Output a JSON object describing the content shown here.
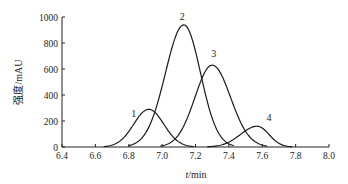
{
  "chart_data": {
    "type": "line",
    "title": "",
    "xlabel": "t/min",
    "ylabel": "强度/mAU",
    "xlim": [
      6.4,
      8.0
    ],
    "ylim": [
      0,
      1000
    ],
    "xticks": [
      "6.4",
      "6.6",
      "6.8",
      "7.0",
      "7.2",
      "7.4",
      "7.6",
      "7.8",
      "8.0"
    ],
    "yticks": [
      "0",
      "200",
      "400",
      "600",
      "800",
      "1000"
    ],
    "grid": false,
    "legend": null,
    "series": [
      {
        "name": "1",
        "center": 6.92,
        "height": 290,
        "start": 6.65,
        "end": 7.19
      },
      {
        "name": "2",
        "center": 7.13,
        "height": 940,
        "start": 6.8,
        "end": 7.43
      },
      {
        "name": "3",
        "center": 7.3,
        "height": 630,
        "start": 6.99,
        "end": 7.63
      },
      {
        "name": "4",
        "center": 7.57,
        "height": 160,
        "start": 7.27,
        "end": 7.78
      }
    ],
    "annotations": [
      {
        "text": "1",
        "x": 6.83,
        "y": 230
      },
      {
        "text": "2",
        "x": 7.12,
        "y": 980
      },
      {
        "text": "3",
        "x": 7.31,
        "y": 690
      },
      {
        "text": "4",
        "x": 7.64,
        "y": 200
      }
    ]
  }
}
